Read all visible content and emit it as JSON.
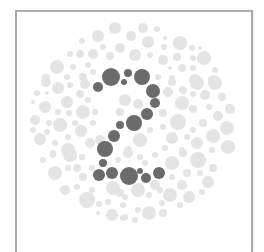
{
  "plate": {
    "type": "ishihara-color-test-plate",
    "hidden_number": "2",
    "colors": {
      "figure": "#6b6b6b",
      "background_dots": "#e4e4e4",
      "frame": "#a8a8a8",
      "page": "#ffffff"
    },
    "figure_dots": [
      [
        111,
        77,
        9
      ],
      [
        128,
        73,
        4
      ],
      [
        124,
        82,
        3
      ],
      [
        142,
        77,
        8
      ],
      [
        98,
        87,
        5
      ],
      [
        153,
        91,
        7
      ],
      [
        155,
        103,
        5
      ],
      [
        147,
        114,
        6
      ],
      [
        134,
        123,
        8
      ],
      [
        120,
        125,
        4
      ],
      [
        114,
        136,
        6
      ],
      [
        105,
        149,
        8
      ],
      [
        103,
        163,
        4
      ],
      [
        99,
        175,
        6
      ],
      [
        112,
        173,
        6
      ],
      [
        129,
        176,
        9
      ],
      [
        140,
        171,
        3
      ],
      [
        146,
        178,
        5
      ],
      [
        159,
        173,
        6
      ]
    ],
    "background_dots": [
      [
        115,
        28,
        6
      ],
      [
        98,
        36,
        6
      ],
      [
        82,
        41,
        3
      ],
      [
        120,
        48,
        5
      ],
      [
        103,
        47,
        3
      ],
      [
        93,
        54,
        5
      ],
      [
        80,
        54,
        4
      ],
      [
        70,
        54,
        3
      ],
      [
        110,
        56,
        4
      ],
      [
        57,
        67,
        7
      ],
      [
        73,
        67,
        3
      ],
      [
        88,
        65,
        3
      ],
      [
        93,
        72,
        3
      ],
      [
        83,
        77,
        4
      ],
      [
        67,
        77,
        3
      ],
      [
        46,
        78,
        4
      ],
      [
        143,
        28,
        5
      ],
      [
        157,
        29,
        3
      ],
      [
        131,
        36,
        5
      ],
      [
        148,
        42,
        6
      ],
      [
        164,
        47,
        3
      ],
      [
        165,
        38,
        2
      ],
      [
        180,
        43,
        7
      ],
      [
        192,
        48,
        3
      ],
      [
        200,
        48,
        2
      ],
      [
        135,
        55,
        6
      ],
      [
        150,
        55,
        3
      ],
      [
        163,
        60,
        5
      ],
      [
        177,
        57,
        4
      ],
      [
        193,
        58,
        3
      ],
      [
        204,
        58,
        7
      ],
      [
        215,
        70,
        3
      ],
      [
        182,
        68,
        4
      ],
      [
        193,
        68,
        3
      ],
      [
        170,
        68,
        2
      ],
      [
        158,
        77,
        3
      ],
      [
        172,
        78,
        3
      ],
      [
        195,
        80,
        6
      ],
      [
        213,
        80,
        5
      ],
      [
        46,
        82,
        5
      ],
      [
        58,
        88,
        6
      ],
      [
        70,
        85,
        3
      ],
      [
        85,
        84,
        5
      ],
      [
        37,
        93,
        3
      ],
      [
        47,
        93,
        2
      ],
      [
        67,
        102,
        6
      ],
      [
        80,
        94,
        4
      ],
      [
        88,
        100,
        3
      ],
      [
        45,
        107,
        6
      ],
      [
        33,
        102,
        2
      ],
      [
        58,
        112,
        3
      ],
      [
        69,
        113,
        3
      ],
      [
        83,
        112,
        7
      ],
      [
        35,
        120,
        5
      ],
      [
        49,
        123,
        3
      ],
      [
        60,
        125,
        7
      ],
      [
        75,
        123,
        3
      ],
      [
        93,
        123,
        3
      ],
      [
        33,
        130,
        3
      ],
      [
        47,
        132,
        3
      ],
      [
        81,
        131,
        6
      ],
      [
        68,
        137,
        3
      ],
      [
        40,
        139,
        6
      ],
      [
        55,
        143,
        3
      ],
      [
        90,
        143,
        5
      ],
      [
        68,
        150,
        7
      ],
      [
        53,
        153,
        3
      ],
      [
        82,
        157,
        3
      ],
      [
        197,
        83,
        7
      ],
      [
        215,
        83,
        7
      ],
      [
        172,
        82,
        4
      ],
      [
        168,
        92,
        5
      ],
      [
        183,
        90,
        4
      ],
      [
        205,
        95,
        5
      ],
      [
        222,
        97,
        4
      ],
      [
        193,
        94,
        3
      ],
      [
        182,
        103,
        7
      ],
      [
        163,
        113,
        4
      ],
      [
        193,
        109,
        4
      ],
      [
        209,
        107,
        3
      ],
      [
        230,
        109,
        5
      ],
      [
        218,
        116,
        5
      ],
      [
        178,
        122,
        8
      ],
      [
        203,
        123,
        4
      ],
      [
        227,
        128,
        7
      ],
      [
        193,
        130,
        3
      ],
      [
        163,
        127,
        3
      ],
      [
        213,
        136,
        7
      ],
      [
        172,
        138,
        6
      ],
      [
        187,
        137,
        3
      ],
      [
        197,
        143,
        6
      ],
      [
        165,
        148,
        3
      ],
      [
        228,
        147,
        7
      ],
      [
        182,
        150,
        3
      ],
      [
        212,
        150,
        3
      ],
      [
        200,
        157,
        4
      ],
      [
        70,
        155,
        7
      ],
      [
        53,
        155,
        3
      ],
      [
        43,
        160,
        3
      ],
      [
        82,
        157,
        3
      ],
      [
        55,
        173,
        7
      ],
      [
        68,
        168,
        3
      ],
      [
        77,
        168,
        4
      ],
      [
        83,
        177,
        4
      ],
      [
        92,
        168,
        3
      ],
      [
        65,
        190,
        5
      ],
      [
        77,
        187,
        3
      ],
      [
        87,
        200,
        8
      ],
      [
        113,
        188,
        7
      ],
      [
        112,
        215,
        6
      ],
      [
        99,
        204,
        3
      ],
      [
        108,
        202,
        3
      ],
      [
        123,
        205,
        3
      ],
      [
        98,
        213,
        2
      ],
      [
        120,
        193,
        4
      ],
      [
        123,
        218,
        3
      ],
      [
        128,
        153,
        5
      ],
      [
        140,
        157,
        3
      ],
      [
        155,
        155,
        3
      ],
      [
        172,
        163,
        7
      ],
      [
        183,
        153,
        4
      ],
      [
        198,
        160,
        8
      ],
      [
        187,
        173,
        4
      ],
      [
        172,
        177,
        3
      ],
      [
        200,
        173,
        3
      ],
      [
        208,
        182,
        6
      ],
      [
        213,
        168,
        4
      ],
      [
        182,
        185,
        5
      ],
      [
        155,
        185,
        5
      ],
      [
        138,
        190,
        7
      ],
      [
        125,
        197,
        3
      ],
      [
        170,
        195,
        7
      ],
      [
        189,
        197,
        6
      ],
      [
        202,
        192,
        3
      ],
      [
        149,
        195,
        3
      ],
      [
        162,
        203,
        3
      ],
      [
        180,
        205,
        3
      ],
      [
        138,
        210,
        3
      ],
      [
        149,
        213,
        7
      ],
      [
        163,
        213,
        4
      ],
      [
        125,
        217,
        3
      ],
      [
        135,
        220,
        3
      ],
      [
        100,
        140,
        5
      ],
      [
        125,
        100,
        6
      ],
      [
        138,
        104,
        5
      ],
      [
        120,
        112,
        4
      ],
      [
        95,
        112,
        3
      ],
      [
        140,
        140,
        7
      ],
      [
        128,
        150,
        4
      ],
      [
        150,
        130,
        3
      ],
      [
        160,
        190,
        3
      ],
      [
        118,
        160,
        3
      ],
      [
        92,
        190,
        3
      ],
      [
        145,
        163,
        3
      ]
    ]
  }
}
